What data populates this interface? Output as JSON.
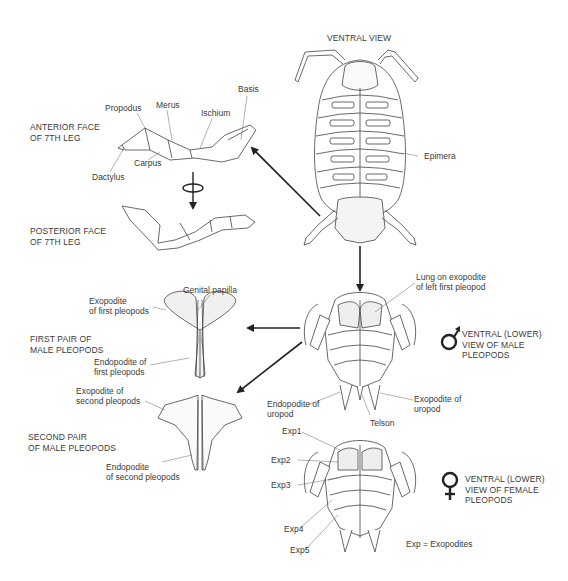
{
  "captions": {
    "ventral_view": "VENTRAL VIEW",
    "anterior_face": "ANTERIOR FACE\nOF 7TH LEG",
    "posterior_face": "POSTERIOR FACE\nOF 7TH LEG",
    "first_pair": "FIRST PAIR OF\nMALE PLEOPODS",
    "second_pair": "SECOND PAIR\nOF MALE PLEOPODS",
    "male_view": "VENTRAL (LOWER)\nVIEW OF MALE\nPLEOPODS",
    "female_view": "VENTRAL (LOWER)\nVIEW OF FEMALE\nPLEOPODS",
    "legend": "Exp = Exopodites"
  },
  "leg_labels": {
    "basis": "Basis",
    "propodus": "Propodus",
    "merus": "Merus",
    "ischium": "Ischium",
    "carpus": "Carpus",
    "dactylus": "Dactylus"
  },
  "body_labels": {
    "epimera": "Epimera"
  },
  "male_pleopod_labels": {
    "genital_papilla": "Genital papilla",
    "exopodite_first": "Exopodite\nof first pleopods",
    "endopodite_first": "Endopodite of\nfirst pleopods",
    "exopodite_second": "Exopodite of\nsecond pleopods",
    "endopodite_second": "Endopodite\nof second pleopods"
  },
  "male_ventral_labels": {
    "lung": "Lung on exopodite\nof left first pleopod",
    "endopodite_uropod": "Endopodite of\nuropod",
    "exopodite_uropod": "Exopodite of\nuropod",
    "telson": "Telson"
  },
  "female_labels": {
    "exp1": "Exp1",
    "exp2": "Exp2",
    "exp3": "Exp3",
    "exp4": "Exp4",
    "exp5": "Exp5"
  },
  "symbols": {
    "male": "male-symbol",
    "female": "female-symbol"
  },
  "colors": {
    "line": "#333333",
    "text": "#3a3a3a",
    "fill": "#f2f2f2"
  }
}
